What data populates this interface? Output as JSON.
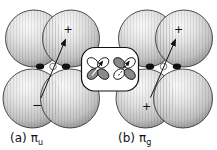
{
  "colors": {
    "background": "#ffffff",
    "outline": "#1a1a1a",
    "sphere_highlight": "#fafafa",
    "sphere_base": "#d6d6d6",
    "sphere_edge": "#8f8f8f",
    "shaded_lobe": "#8a8a8a",
    "unshaded_lobe": "#ffffff"
  },
  "panel_a": {
    "caption_prefix": "(a)",
    "caption_symbol": "π",
    "caption_subscript": "u",
    "top_sign": "+",
    "bottom_sign": "−"
  },
  "panel_b": {
    "caption_prefix": "(b)",
    "caption_symbol": "π",
    "caption_subscript": "g",
    "top_sign": "+",
    "bottom_sign": "+"
  },
  "inset": {
    "left_diagram_icon": "pi-u-phase-schematic (top lobes unshaded, bottom lobes shaded)",
    "right_diagram_icon": "pi-g-phase-schematic (diagonally shaded lobes)"
  }
}
